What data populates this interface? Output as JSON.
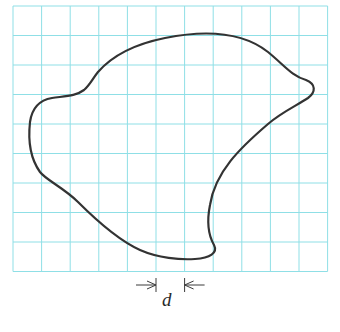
{
  "figure": {
    "type": "irregular-closed-curve-on-grid",
    "grid": {
      "columns": 11,
      "rows": 9,
      "x_lines": [
        13,
        41.6,
        70.2,
        98.8,
        127.4,
        156,
        184.6,
        213.2,
        241.8,
        270.4,
        299,
        327.6
      ],
      "y_lines": [
        6,
        35.5,
        65,
        94.5,
        124,
        153.5,
        183,
        212.5,
        242,
        271.5
      ],
      "line_color": "#8fdfe6",
      "line_width": 1
    },
    "curve": {
      "stroke_color": "#333333",
      "stroke_width": 2.2,
      "path": "M 98 72 C 112 56, 135 44, 165 38 C 200 31, 240 30, 268 52 C 285 66, 292 76, 306 80 C 316 84, 316 92, 308 98 C 296 106, 282 112, 268 124 C 240 148, 215 172, 210 205 C 206 225, 210 238, 214 245 C 218 253, 210 258, 195 259 C 180 260, 158 258, 140 250 C 118 240, 98 222, 78 202 C 64 188, 46 180, 40 172 C 30 158, 28 140, 30 122 C 32 108, 40 100, 52 98 C 66 96, 76 96, 84 90 C 90 85, 93 78, 98 72 Z"
    },
    "dimension": {
      "label": "d",
      "left_tick_x": 156,
      "right_tick_x": 184.6,
      "y": 285
    }
  }
}
